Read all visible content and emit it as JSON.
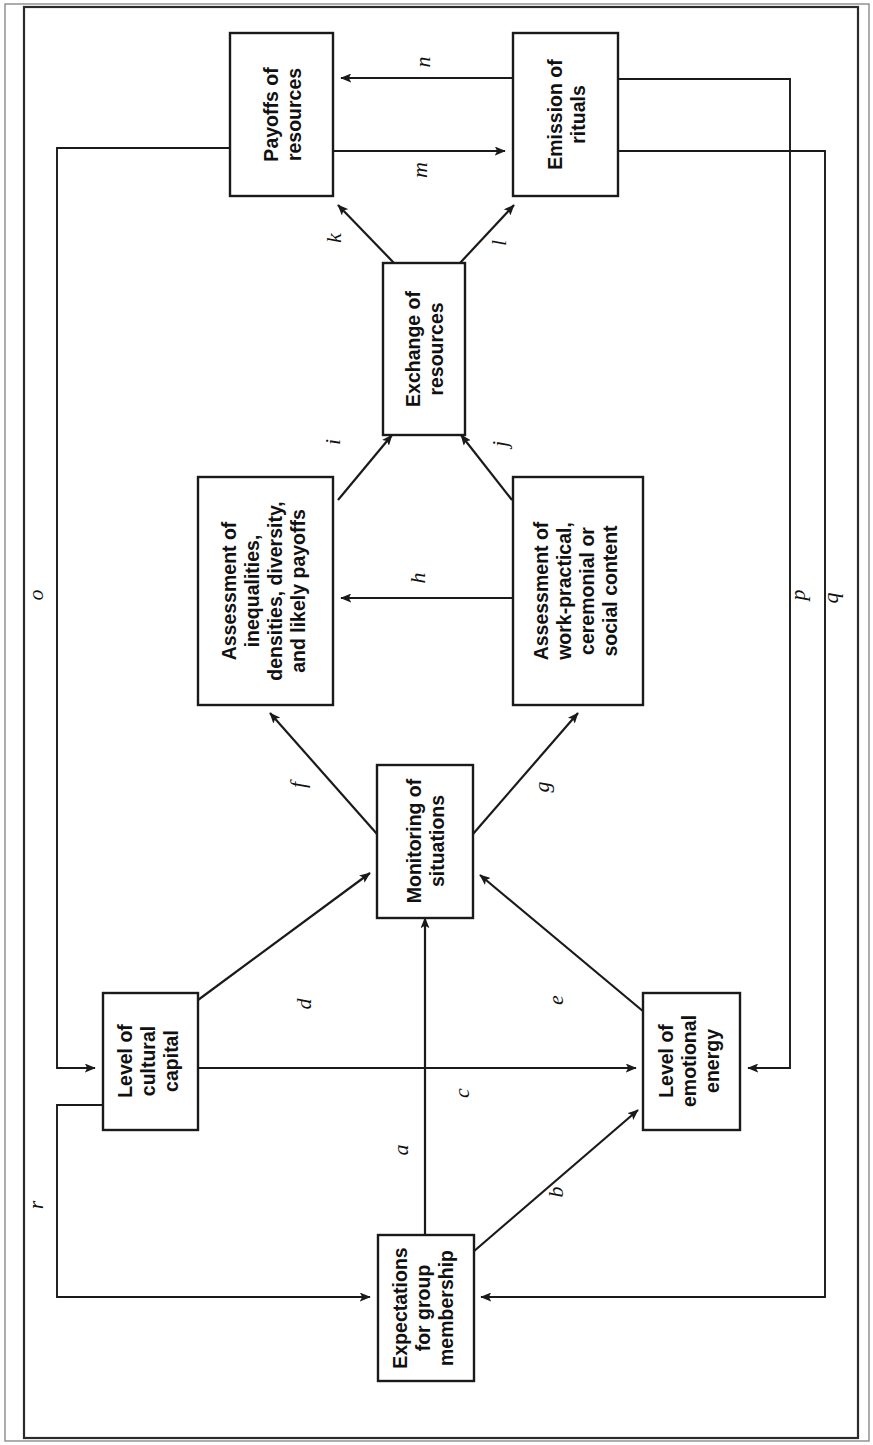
{
  "figure": {
    "type": "flow-diagram",
    "orientation": "rotated-90-ccw",
    "nodes": [
      {
        "id": "payoffs",
        "label": "Payoffs of\nresources"
      },
      {
        "id": "emission",
        "label": "Emission of\nrituals"
      },
      {
        "id": "exchange",
        "label": "Exchange of\nresources"
      },
      {
        "id": "assess_ineq",
        "label": "Assessment of\ninequalities,\ndensities, diversity,\nand likely payoffs"
      },
      {
        "id": "assess_work",
        "label": "Assessment of\nwork-practical,\nceremonial or\nsocial content"
      },
      {
        "id": "monitoring",
        "label": "Monitoring of\nsituations"
      },
      {
        "id": "cultural",
        "label": "Level of\ncultural\ncapital"
      },
      {
        "id": "emotional",
        "label": "Level of\nemotional\nenergy"
      },
      {
        "id": "expect",
        "label": "Expectations\nfor group\nmembership"
      }
    ],
    "edges": [
      {
        "label": "a",
        "from": "expect",
        "to": "monitoring"
      },
      {
        "label": "b",
        "from": "expect",
        "to": "emotional"
      },
      {
        "label": "c",
        "from": "cultural",
        "to": "emotional"
      },
      {
        "label": "d",
        "from": "cultural",
        "to": "monitoring"
      },
      {
        "label": "e",
        "from": "emotional",
        "to": "monitoring"
      },
      {
        "label": "f",
        "from": "monitoring",
        "to": "assess_ineq"
      },
      {
        "label": "g",
        "from": "monitoring",
        "to": "assess_work"
      },
      {
        "label": "h",
        "from": "assess_work",
        "to": "assess_ineq"
      },
      {
        "label": "i",
        "from": "assess_ineq",
        "to": "exchange"
      },
      {
        "label": "j",
        "from": "assess_work",
        "to": "exchange"
      },
      {
        "label": "k",
        "from": "exchange",
        "to": "payoffs"
      },
      {
        "label": "l",
        "from": "exchange",
        "to": "emission"
      },
      {
        "label": "m",
        "from": "payoffs",
        "to": "emission"
      },
      {
        "label": "n",
        "from": "emission",
        "to": "payoffs"
      },
      {
        "label": "o",
        "from": "payoffs",
        "to": "cultural"
      },
      {
        "label": "p",
        "from": "emission",
        "to": "emotional"
      },
      {
        "label": "q",
        "from": "emission",
        "to": "expect"
      },
      {
        "label": "r",
        "from": "cultural",
        "to": "expect"
      }
    ],
    "labels": {
      "a": "a",
      "b": "b",
      "c": "c",
      "d": "d",
      "e": "e",
      "f": "f",
      "g": "g",
      "h": "h",
      "i": "i",
      "j": "j",
      "k": "k",
      "l": "l",
      "m": "m",
      "n": "n",
      "o": "o",
      "p": "p",
      "q": "q",
      "r": "r"
    },
    "node_labels": {
      "payoffs_l1": "Payoffs of",
      "payoffs_l2": "resources",
      "emission_l1": "Emission of",
      "emission_l2": "rituals",
      "exchange_l1": "Exchange of",
      "exchange_l2": "resources",
      "assess_ineq_l1": "Assessment of",
      "assess_ineq_l2": "inequalities,",
      "assess_ineq_l3": "densities, diversity,",
      "assess_ineq_l4": "and likely payoffs",
      "assess_work_l1": "Assessment of",
      "assess_work_l2": "work-practical,",
      "assess_work_l3": "ceremonial or",
      "assess_work_l4": "social content",
      "monitoring_l1": "Monitoring of",
      "monitoring_l2": "situations",
      "cultural_l1": "Level of",
      "cultural_l2": "cultural",
      "cultural_l3": "capital",
      "emotional_l1": "Level of",
      "emotional_l2": "emotional",
      "emotional_l3": "energy",
      "expect_l1": "Expectations",
      "expect_l2": "for group",
      "expect_l3": "membership"
    },
    "colors": {
      "ink": "#1a1a1a",
      "paper": "#ffffff",
      "frame": "#2b2b2b"
    }
  }
}
